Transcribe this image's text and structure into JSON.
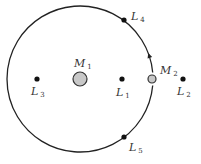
{
  "diagram": {
    "colors": {
      "orbit": "#222222",
      "point": "#111111",
      "mass_fill": "#c8c8c8",
      "mass_stroke": "#333333",
      "text": "#333333"
    },
    "orbit": {
      "cx": 80,
      "cy": 79,
      "r": 73,
      "direction": "counterclockwise"
    },
    "masses": [
      {
        "id": "M1",
        "letter": "M",
        "sub": "1",
        "x": 80,
        "y": 79,
        "r": 7,
        "label_x": 74,
        "label_y": 67
      },
      {
        "id": "M2",
        "letter": "M",
        "sub": "2",
        "x": 152,
        "y": 79,
        "r": 4,
        "label_x": 160,
        "label_y": 74
      }
    ],
    "lagrange_points": [
      {
        "id": "L1",
        "letter": "L",
        "sub": "1",
        "x": 122,
        "y": 79,
        "label_x": 116,
        "label_y": 96
      },
      {
        "id": "L2",
        "letter": "L",
        "sub": "2",
        "x": 183,
        "y": 79,
        "label_x": 177,
        "label_y": 95
      },
      {
        "id": "L3",
        "letter": "L",
        "sub": "3",
        "x": 37,
        "y": 79,
        "label_x": 31,
        "label_y": 95
      },
      {
        "id": "L4",
        "letter": "L",
        "sub": "4",
        "x": 124,
        "y": 20,
        "label_x": 131,
        "label_y": 20
      },
      {
        "id": "L5",
        "letter": "L",
        "sub": "5",
        "x": 124,
        "y": 137,
        "label_x": 129,
        "label_y": 151
      }
    ]
  }
}
